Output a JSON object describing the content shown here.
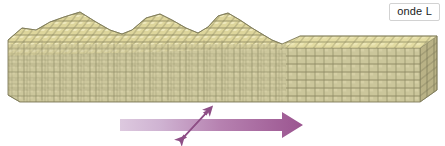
{
  "figure": {
    "type": "seismic-wave-block-diagram",
    "background_color": "#ffffff",
    "width": 445,
    "height": 146
  },
  "label": {
    "text": "onde L",
    "box_fill": "#ffffff",
    "box_border": "#d2d2d2",
    "text_color": "#1a1a1a"
  },
  "block": {
    "name": "cube-lattice-block",
    "top_face_color": "#e3dca3",
    "front_face_color": "#cbc69b",
    "side_face_color": "#b9b286",
    "grid_line_color": "#8d8a63",
    "deformed_region_label": "compressed-ridges",
    "undeformed_region_label": "flat-undeformed",
    "ridge_count": 3,
    "ridge_peaks_x": [
      80,
      148,
      215
    ],
    "ridge_apex_y": 12,
    "block_left_x": 8,
    "block_right_x": 437,
    "block_bottom_y": 102,
    "flat_top_y": 40
  },
  "arrows": {
    "propagation": {
      "name": "wave-propagation-arrow",
      "direction": "right",
      "gradient_start": "#ddc9df",
      "gradient_end": "#9b5590",
      "shaft_x1": 120,
      "shaft_x2": 282,
      "shaft_y": 125,
      "tip_x": 303
    },
    "oscillation": {
      "name": "particle-motion-double-arrow",
      "direction": "diagonal-双-headed",
      "color": "#8e4f86",
      "x1": 180,
      "y1": 141,
      "x2": 211,
      "y2": 109
    }
  }
}
